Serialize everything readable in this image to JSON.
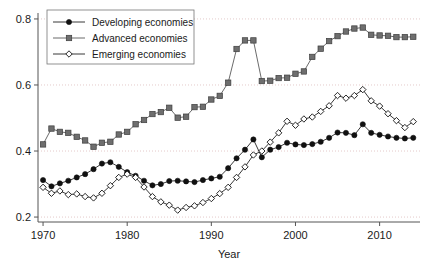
{
  "chart_data": {
    "type": "line",
    "title": "",
    "xlabel": "Year",
    "ylabel": "",
    "xlim": [
      1969.4,
      2014.8
    ],
    "ylim": [
      0.185,
      0.815
    ],
    "xticks": [
      1970,
      1980,
      1990,
      2000,
      2010
    ],
    "xtick_labels": [
      "1970",
      "1980",
      "1990",
      "2000",
      "2010"
    ],
    "yticks": [
      0.2,
      0.4,
      0.6,
      0.8
    ],
    "ytick_labels": [
      "0.2",
      "0.4",
      "0.6",
      "0.8"
    ],
    "grid": "horizontal-dotted",
    "legend_position": "top-left",
    "x": [
      1970,
      1971,
      1972,
      1973,
      1974,
      1975,
      1976,
      1977,
      1978,
      1979,
      1980,
      1981,
      1982,
      1983,
      1984,
      1985,
      1986,
      1987,
      1988,
      1989,
      1990,
      1991,
      1992,
      1993,
      1994,
      1995,
      1996,
      1997,
      1998,
      1999,
      2000,
      2001,
      2002,
      2003,
      2004,
      2005,
      2006,
      2007,
      2008,
      2009,
      2010,
      2011,
      2012,
      2013,
      2014
    ],
    "series": [
      {
        "name": "Developing economies",
        "marker": "filled-circle",
        "color": "#111111",
        "values": [
          0.312,
          0.293,
          0.302,
          0.31,
          0.32,
          0.33,
          0.345,
          0.362,
          0.366,
          0.352,
          0.336,
          0.325,
          0.31,
          0.296,
          0.3,
          0.309,
          0.31,
          0.308,
          0.306,
          0.312,
          0.317,
          0.322,
          0.348,
          0.378,
          0.404,
          0.435,
          0.381,
          0.404,
          0.412,
          0.425,
          0.42,
          0.418,
          0.421,
          0.428,
          0.44,
          0.456,
          0.455,
          0.448,
          0.481,
          0.455,
          0.449,
          0.444,
          0.44,
          0.438,
          0.44
        ]
      },
      {
        "name": "Advanced economies",
        "marker": "filled-square",
        "color": "#6e6e6e",
        "values": [
          0.42,
          0.468,
          0.458,
          0.455,
          0.443,
          0.432,
          0.413,
          0.425,
          0.428,
          0.45,
          0.458,
          0.481,
          0.494,
          0.512,
          0.518,
          0.531,
          0.501,
          0.504,
          0.533,
          0.534,
          0.556,
          0.567,
          0.607,
          0.709,
          0.735,
          0.735,
          0.612,
          0.613,
          0.621,
          0.622,
          0.634,
          0.641,
          0.685,
          0.71,
          0.733,
          0.748,
          0.762,
          0.771,
          0.774,
          0.752,
          0.75,
          0.749,
          0.745,
          0.745,
          0.746
        ]
      },
      {
        "name": "Emerging economies",
        "marker": "open-diamond",
        "color": "#111111",
        "values": [
          0.29,
          0.272,
          0.279,
          0.268,
          0.27,
          0.262,
          0.258,
          0.272,
          0.295,
          0.32,
          0.33,
          0.32,
          0.291,
          0.262,
          0.246,
          0.236,
          0.221,
          0.229,
          0.234,
          0.244,
          0.256,
          0.271,
          0.29,
          0.32,
          0.352,
          0.388,
          0.4,
          0.427,
          0.455,
          0.49,
          0.478,
          0.497,
          0.503,
          0.52,
          0.537,
          0.568,
          0.56,
          0.568,
          0.586,
          0.552,
          0.536,
          0.513,
          0.492,
          0.471,
          0.489
        ]
      }
    ]
  },
  "legend": {
    "entries": [
      {
        "label": "Developing economies",
        "marker": "filled-circle"
      },
      {
        "label": "Advanced economies",
        "marker": "filled-square"
      },
      {
        "label": "Emerging economies",
        "marker": "open-diamond"
      }
    ]
  }
}
